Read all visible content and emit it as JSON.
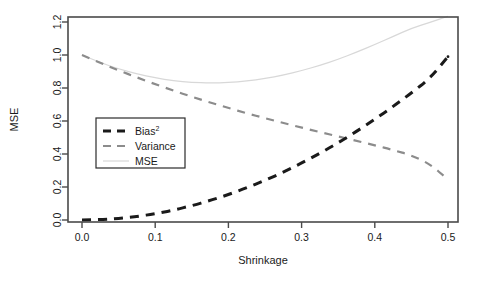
{
  "chart_data": {
    "type": "line",
    "title": "",
    "xlabel": "Shrinkage",
    "ylabel": "MSE",
    "xlim": [
      0.0,
      0.5
    ],
    "ylim": [
      0.0,
      1.25
    ],
    "xticks": [
      "0.0",
      "0.1",
      "0.2",
      "0.3",
      "0.4",
      "0.5"
    ],
    "xtick_values": [
      0.0,
      0.1,
      0.2,
      0.3,
      0.4,
      0.5
    ],
    "yticks": [
      "0.0",
      "0.2",
      "0.4",
      "0.6",
      "0.8",
      "1.0",
      "1.2"
    ],
    "ytick_values": [
      0.0,
      0.2,
      0.4,
      0.6,
      0.8,
      1.0,
      1.2
    ],
    "grid": false,
    "legend_position": "center-left",
    "x": [
      0.0,
      0.025,
      0.05,
      0.075,
      0.1,
      0.125,
      0.15,
      0.175,
      0.2,
      0.225,
      0.25,
      0.275,
      0.3,
      0.325,
      0.35,
      0.375,
      0.4,
      0.425,
      0.45,
      0.475,
      0.5
    ],
    "series": [
      {
        "name": "Bias²",
        "label": "Bias",
        "superscript": "2",
        "color": "#1a1a1a",
        "style": "dashed",
        "width": 3.0,
        "values": [
          0.0,
          0.002,
          0.009,
          0.021,
          0.038,
          0.06,
          0.087,
          0.118,
          0.154,
          0.195,
          0.24,
          0.29,
          0.345,
          0.404,
          0.468,
          0.537,
          0.61,
          0.688,
          0.77,
          0.857,
          0.99
        ]
      },
      {
        "name": "Variance",
        "label": "Variance",
        "color": "#8c8c8c",
        "style": "dashed",
        "width": 2.2,
        "values": [
          1.0,
          0.952,
          0.907,
          0.864,
          0.823,
          0.784,
          0.747,
          0.712,
          0.679,
          0.647,
          0.617,
          0.588,
          0.56,
          0.533,
          0.506,
          0.48,
          0.453,
          0.424,
          0.392,
          0.34,
          0.245
        ]
      },
      {
        "name": "MSE",
        "label": "MSE",
        "color": "#d8d8d8",
        "style": "solid",
        "width": 1.2,
        "values": [
          1.0,
          0.954,
          0.916,
          0.885,
          0.861,
          0.844,
          0.834,
          0.83,
          0.833,
          0.842,
          0.857,
          0.878,
          0.905,
          0.937,
          0.974,
          1.017,
          1.063,
          1.112,
          1.162,
          1.197,
          1.235
        ]
      }
    ],
    "legend": {
      "items": [
        {
          "label": "Bias",
          "superscript": "2",
          "color": "#1a1a1a",
          "style": "dashed",
          "width": 3.0
        },
        {
          "label": "Variance",
          "superscript": "",
          "color": "#8c8c8c",
          "style": "dashed",
          "width": 2.2
        },
        {
          "label": "MSE",
          "superscript": "",
          "color": "#d8d8d8",
          "style": "solid",
          "width": 1.2
        }
      ]
    },
    "frame_color": "#4a4a4a",
    "background": "#ffffff"
  }
}
